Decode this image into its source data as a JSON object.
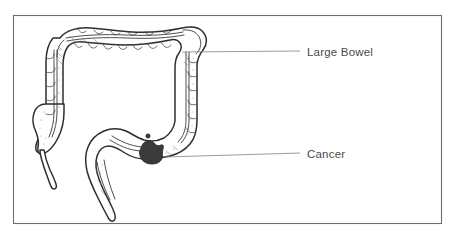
{
  "figure": {
    "background_color": "#ffffff",
    "frame": {
      "stroke_color": "#6e6e6e",
      "x": 13,
      "y": 15,
      "width": 429,
      "height": 209
    },
    "labels": [
      {
        "id": "large-bowel",
        "text": "Large Bowel",
        "text_x": 307,
        "text_y": 56,
        "color": "#4a4a4a",
        "leader_from_x": 182,
        "leader_from_y": 52,
        "leader_to_x": 300,
        "leader_to_y": 51
      },
      {
        "id": "cancer",
        "text": "Cancer",
        "text_x": 307,
        "text_y": 158,
        "color": "#4a4a4a",
        "leader_from_x": 165,
        "leader_from_y": 157,
        "leader_to_x": 300,
        "leader_to_y": 153
      }
    ],
    "anatomy": {
      "organ_name": "Large Bowel",
      "outline_color": "#2e2e2e",
      "fill_color": "#ffffff",
      "lesion": {
        "name": "Cancer",
        "fill_color": "#3a3a3a",
        "center_x": 152,
        "center_y": 155
      },
      "parts": [
        "transverse colon",
        "hepatic flexure",
        "ascending colon",
        "cecum",
        "appendix",
        "splenic flexure",
        "descending colon",
        "sigmoid colon",
        "rectum"
      ]
    }
  }
}
